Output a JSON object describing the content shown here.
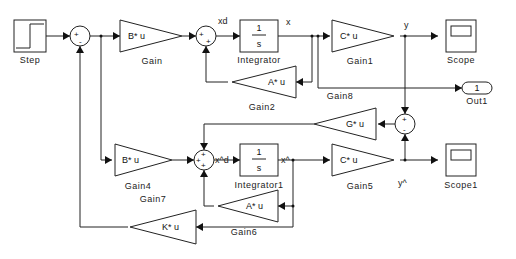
{
  "diagram": {
    "type": "simulink-block-diagram",
    "colors": {
      "line": "#222222",
      "background": "#ffffff"
    },
    "blocks": {
      "step": {
        "label": "Step"
      },
      "gain": {
        "label": "Gain",
        "expr": "B* u"
      },
      "integrator": {
        "label": "Integrator",
        "num": "1",
        "den": "s"
      },
      "gain1": {
        "label": "Gain1",
        "expr": "C* u"
      },
      "scope": {
        "label": "Scope"
      },
      "gain2": {
        "label": "Gain2",
        "expr": "A* u"
      },
      "gain8": {
        "label": "Gain8"
      },
      "out1": {
        "label": "Out1",
        "port": "1"
      },
      "gain_g": {
        "expr": "G* u"
      },
      "gain4": {
        "label": "Gain4",
        "expr": "B* u"
      },
      "gain7": {
        "label": "Gain7"
      },
      "integrator1": {
        "label": "Integrator1",
        "num": "1",
        "den": "s"
      },
      "gain5": {
        "label": "Gain5",
        "expr": "C* u"
      },
      "scope1": {
        "label": "Scope1"
      },
      "gain6": {
        "label": "Gain6",
        "expr": "A* u"
      },
      "gain_k": {
        "expr": "K* u"
      }
    },
    "sums": {
      "sum1": {
        "signs": [
          "+",
          "-"
        ]
      },
      "sum2": {
        "signs": [
          "+",
          "+"
        ]
      },
      "sum3": {
        "signs": [
          "+",
          "+",
          "+"
        ]
      },
      "sum4": {
        "signs": [
          "+",
          "-"
        ]
      }
    },
    "signals": {
      "xd": "xd",
      "x": "x",
      "y": "y",
      "xhat_d": "x^d",
      "xhat": "x^",
      "yhat": "y^"
    }
  }
}
